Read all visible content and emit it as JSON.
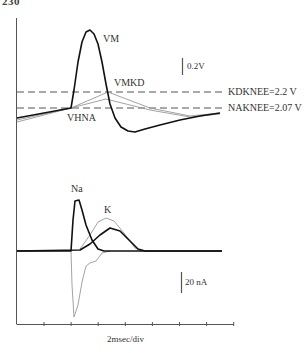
{
  "page": {
    "number": "230"
  },
  "chart_data": [
    {
      "type": "line",
      "title": "Membrane potential (VM) with linear approximations and knee thresholds",
      "xlabel": "2msec/div",
      "ylabel": "",
      "scale_bar": "0.2V",
      "grid": false,
      "series": [
        {
          "name": "VM",
          "style": "thick black",
          "points_px": [
            [
              17,
              118
            ],
            [
              71,
              108
            ],
            [
              74,
              90
            ],
            [
              78,
              62
            ],
            [
              82,
              42
            ],
            [
              86,
              32
            ],
            [
              90,
              30
            ],
            [
              94,
              34
            ],
            [
              98,
              44
            ],
            [
              102,
              62
            ],
            [
              106,
              84
            ],
            [
              110,
              104
            ],
            [
              115,
              118
            ],
            [
              121,
              127
            ],
            [
              128,
              131
            ],
            [
              135,
              132
            ],
            [
              145,
              129
            ],
            [
              160,
              125
            ],
            [
              180,
              120
            ],
            [
              200,
              116
            ],
            [
              220,
              113
            ]
          ]
        },
        {
          "name": "VMKD",
          "style": "thin gray",
          "points_px": [
            [
              17,
              122
            ],
            [
              71,
              108
            ],
            [
              108,
              92
            ],
            [
              150,
              108
            ],
            [
              190,
              116
            ],
            [
              220,
              113
            ]
          ]
        },
        {
          "name": "VHNA",
          "style": "thin gray",
          "points_px": [
            [
              17,
              120
            ],
            [
              71,
              108
            ],
            [
              106,
              99
            ],
            [
              150,
              110
            ],
            [
              190,
              117
            ],
            [
              220,
              114
            ]
          ]
        }
      ],
      "reference_lines": [
        {
          "name": "KDKNEE",
          "label": "KDKNEE=2.2 V",
          "value_v": 2.2,
          "style": "dashed"
        },
        {
          "name": "NAKNEE",
          "label": "NAKNEE=2.07 V",
          "value_v": 2.07,
          "style": "dashed"
        }
      ],
      "annotations": [
        "VM",
        "VMKD",
        "VHNA"
      ]
    },
    {
      "type": "line",
      "title": "Ionic currents",
      "xlabel": "2msec/div",
      "ylabel": "",
      "scale_bar": "20 nA",
      "grid": false,
      "x_ticks_count": 8,
      "series": [
        {
          "name": "Na",
          "style": "thick black",
          "points_px": [
            [
              17,
              251
            ],
            [
              71,
              251
            ],
            [
              73,
              220
            ],
            [
              75,
              201
            ],
            [
              79,
              200
            ],
            [
              82,
              210
            ],
            [
              86,
              225
            ],
            [
              92,
              240
            ],
            [
              98,
              249
            ],
            [
              104,
              251
            ],
            [
              222,
              251
            ]
          ]
        },
        {
          "name": "K",
          "style": "thick black",
          "points_px": [
            [
              17,
              251
            ],
            [
              80,
              250
            ],
            [
              90,
              244
            ],
            [
              100,
              235
            ],
            [
              110,
              228
            ],
            [
              120,
              231
            ],
            [
              130,
              241
            ],
            [
              138,
              249
            ],
            [
              145,
              251
            ],
            [
              222,
              251
            ]
          ]
        },
        {
          "name": "K (approx)",
          "style": "thin gray",
          "points_px": [
            [
              80,
              249
            ],
            [
              90,
              235
            ],
            [
              98,
              222
            ],
            [
              106,
              218
            ],
            [
              114,
              221
            ],
            [
              124,
              233
            ],
            [
              135,
              248
            ],
            [
              142,
              251
            ]
          ]
        },
        {
          "name": "Total inward (approx)",
          "style": "thin gray",
          "points_px": [
            [
              71,
              251
            ],
            [
              72,
              285
            ],
            [
              74,
              317
            ],
            [
              78,
              305
            ],
            [
              82,
              282
            ],
            [
              86,
              266
            ],
            [
              90,
              263
            ],
            [
              96,
              261
            ],
            [
              102,
              253
            ],
            [
              110,
              251
            ]
          ]
        }
      ],
      "annotations": [
        "Na",
        "K"
      ]
    }
  ],
  "labels": {
    "vm": "VM",
    "vmkd": "VMKD",
    "vhna": "VHNA",
    "kdknee": "KDKNEE=2.2 V",
    "naknee": "NAKNEE=2.07 V",
    "volt_scale": "0.2V",
    "na": "Na",
    "k": "K",
    "current_scale": "20 nA",
    "time_scale": "2msec/div"
  }
}
